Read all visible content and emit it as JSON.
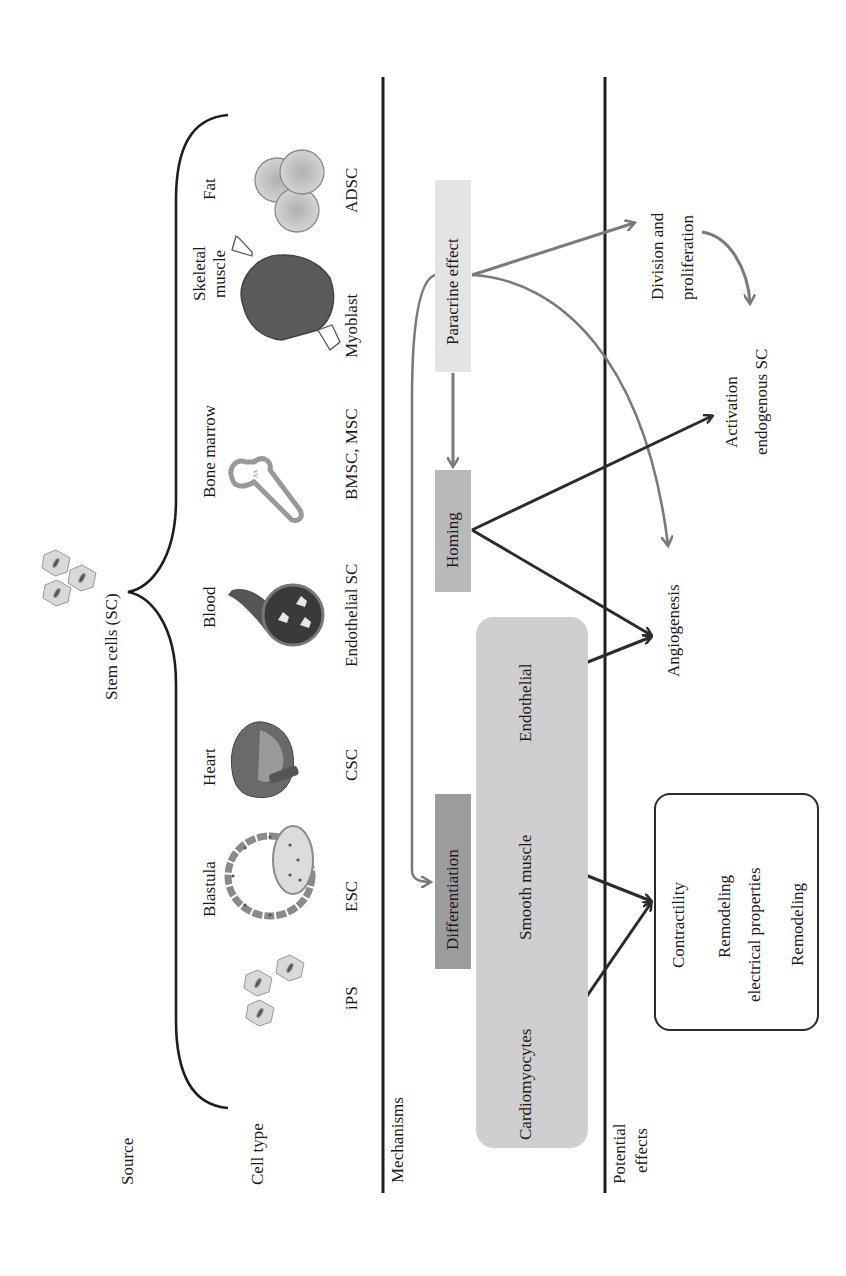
{
  "diagram": {
    "title": "Stem cells (SC)",
    "row_labels": {
      "source": "Source",
      "cell_type": "Cell type",
      "mechanisms": "Mechanisms",
      "potential_effects_line1": "Potential",
      "potential_effects_line2": "effects"
    },
    "sources": [
      {
        "source": "",
        "cell_type": "iPS",
        "icon": "ips-cells-icon"
      },
      {
        "source": "Blastula",
        "cell_type": "ESC",
        "icon": "blastula-icon"
      },
      {
        "source": "Heart",
        "cell_type": "CSC",
        "icon": "heart-icon"
      },
      {
        "source": "Blood",
        "cell_type": "Endothelial SC",
        "icon": "blood-vessel-icon"
      },
      {
        "source": "Bone marrow",
        "cell_type": "BMSC, MSC",
        "icon": "bone-icon"
      },
      {
        "source_line1": "Skeletal",
        "source_line2": "muscle",
        "cell_type": "Myoblast",
        "icon": "muscle-icon"
      },
      {
        "source": "Fat",
        "cell_type": "ADSC",
        "icon": "fat-cells-icon"
      }
    ],
    "mechanisms": {
      "paracrine": "Paracrine effect",
      "homing": "Homing",
      "differentiation": "Differentiation",
      "differentiated_cells": [
        "Cardiomyocytes",
        "Smooth muscle",
        "Endothelial"
      ]
    },
    "effects": {
      "division_line1": "Division and",
      "division_line2": "proliferation",
      "activation_line1": "Activation",
      "activation_line2": "endogenous SC",
      "angiogenesis": "Angiogenesis",
      "box_items": {
        "contractility": "Contractility",
        "remodeling_elec_line1": "Remodeling",
        "remodeling_elec_line2": "electrical properties",
        "remodeling": "Remodeling"
      }
    },
    "colors": {
      "line_dark": "#2b2b2b",
      "arrow_gray": "#7a7a7a",
      "paracrine_fill": "#e4e4e4",
      "homing_fill": "#b9b9b9",
      "differentiation_fill": "#9c9c9c",
      "celltype_fill": "#cfcfcf"
    }
  }
}
